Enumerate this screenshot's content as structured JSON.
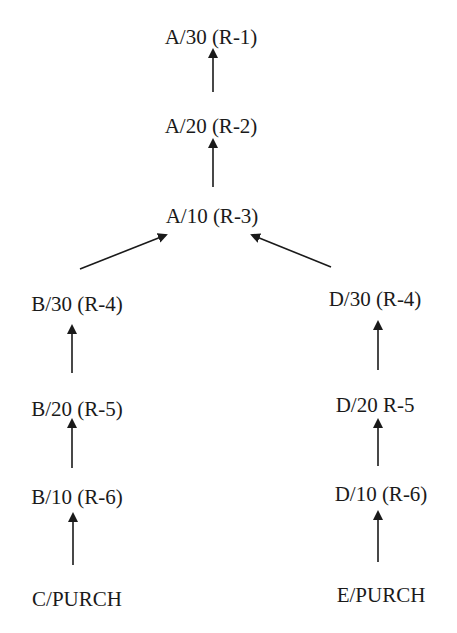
{
  "diagram": {
    "type": "bill-of-materials-routing-tree",
    "nodes": [
      {
        "id": "a30",
        "label": "A/30 (R-1)",
        "cx": 211,
        "top": 27
      },
      {
        "id": "a20",
        "label": "A/20 (R-2)",
        "cx": 211,
        "top": 116
      },
      {
        "id": "a10",
        "label": "A/10 (R-3)",
        "cx": 212,
        "top": 206
      },
      {
        "id": "b30",
        "label": "B/30 (R-4)",
        "cx": 77,
        "top": 294
      },
      {
        "id": "b20",
        "label": "B/20 (R-5)",
        "cx": 77,
        "top": 399
      },
      {
        "id": "b10",
        "label": "B/10 (R-6)",
        "cx": 77,
        "top": 487
      },
      {
        "id": "cpurch",
        "label": "C/PURCH",
        "cx": 77,
        "top": 589
      },
      {
        "id": "d30",
        "label": "D/30 (R-4)",
        "cx": 375,
        "top": 289
      },
      {
        "id": "d20",
        "label": "D/20 R-5",
        "cx": 375,
        "top": 395
      },
      {
        "id": "d10",
        "label": "D/10 (R-6)",
        "cx": 381,
        "top": 484
      },
      {
        "id": "epurch",
        "label": "E/PURCH",
        "cx": 381,
        "top": 585
      }
    ],
    "edges": [
      {
        "from": "a20",
        "to": "a30",
        "x1": 213,
        "y1": 92,
        "x2": 213,
        "y2": 50
      },
      {
        "from": "a10",
        "to": "a20",
        "x1": 213,
        "y1": 187,
        "x2": 213,
        "y2": 140
      },
      {
        "from": "b30",
        "to": "a10",
        "x1": 80,
        "y1": 269,
        "x2": 166,
        "y2": 235
      },
      {
        "from": "d30",
        "to": "a10",
        "x1": 331,
        "y1": 267,
        "x2": 252,
        "y2": 235
      },
      {
        "from": "b20",
        "to": "b30",
        "x1": 72,
        "y1": 373,
        "x2": 72,
        "y2": 326
      },
      {
        "from": "b10",
        "to": "b20",
        "x1": 72,
        "y1": 468,
        "x2": 72,
        "y2": 420
      },
      {
        "from": "cpurch",
        "to": "b10",
        "x1": 73,
        "y1": 565,
        "x2": 73,
        "y2": 514
      },
      {
        "from": "d20",
        "to": "d30",
        "x1": 378,
        "y1": 370,
        "x2": 378,
        "y2": 322
      },
      {
        "from": "d10",
        "to": "d20",
        "x1": 378,
        "y1": 466,
        "x2": 378,
        "y2": 420
      },
      {
        "from": "epurch",
        "to": "d10",
        "x1": 378,
        "y1": 562,
        "x2": 378,
        "y2": 512
      }
    ],
    "colors": {
      "ink": "#1a1a1a",
      "background": "#ffffff"
    }
  }
}
